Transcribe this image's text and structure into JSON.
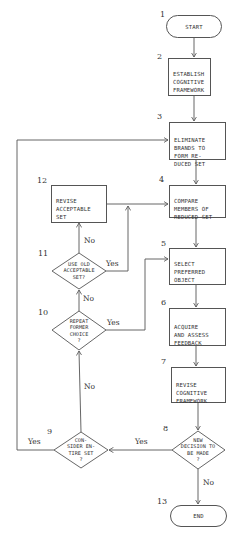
{
  "diagram": {
    "type": "flowchart",
    "nodes": [
      {
        "id": "1",
        "shape": "terminator",
        "number": "1",
        "text": "START"
      },
      {
        "id": "2",
        "shape": "process",
        "number": "2",
        "text": "ESTABLISH\nCOGNITIVE\nFRAMEWORK"
      },
      {
        "id": "3",
        "shape": "process",
        "number": "3",
        "text": "ELIMINATE\nBRANDS TO\nFORM RE-\nDUCED SET"
      },
      {
        "id": "4",
        "shape": "process",
        "number": "4",
        "text": "COMPARE\nMEMBERS OF\nREDUCED SET"
      },
      {
        "id": "5",
        "shape": "process",
        "number": "5",
        "text": "SELECT\nPREFERRED\nOBJECT"
      },
      {
        "id": "6",
        "shape": "process",
        "number": "6",
        "text": "ACQUIRE\nAND ASSESS\nFEEDBACK"
      },
      {
        "id": "7",
        "shape": "process",
        "number": "7",
        "text": "REVISE\nCOGNITIVE\nFRAMEWORK"
      },
      {
        "id": "8",
        "shape": "decision",
        "number": "8",
        "text": "NEW\nDECISION TO\nBE MADE\n?"
      },
      {
        "id": "9",
        "shape": "decision",
        "number": "9",
        "text": "CON-\nSIDER EN-\nTIRE SET\n?"
      },
      {
        "id": "10",
        "shape": "decision",
        "number": "10",
        "text": "REPEAT\nFORMER\nCHOICE\n?"
      },
      {
        "id": "11",
        "shape": "decision",
        "number": "11",
        "text": "USE OLD\nACCEPTABLE\nSET?"
      },
      {
        "id": "12",
        "shape": "process",
        "number": "12",
        "text": "REVISE\nACCEPTABLE\nSET"
      },
      {
        "id": "13",
        "shape": "terminator",
        "number": "13",
        "text": "END"
      }
    ],
    "edges": [
      {
        "from": "1",
        "to": "2",
        "label": ""
      },
      {
        "from": "2",
        "to": "3",
        "label": ""
      },
      {
        "from": "3",
        "to": "4",
        "label": ""
      },
      {
        "from": "4",
        "to": "5",
        "label": ""
      },
      {
        "from": "5",
        "to": "6",
        "label": ""
      },
      {
        "from": "6",
        "to": "7",
        "label": ""
      },
      {
        "from": "7",
        "to": "8",
        "label": ""
      },
      {
        "from": "8",
        "to": "9",
        "label": "Yes"
      },
      {
        "from": "8",
        "to": "13",
        "label": "No"
      },
      {
        "from": "9",
        "to": "3",
        "label": "Yes"
      },
      {
        "from": "9",
        "to": "10",
        "label": "No"
      },
      {
        "from": "10",
        "to": "5",
        "label": "Yes"
      },
      {
        "from": "10",
        "to": "11",
        "label": "No"
      },
      {
        "from": "11",
        "to": "4",
        "label": "Yes"
      },
      {
        "from": "11",
        "to": "12",
        "label": "No"
      },
      {
        "from": "12",
        "to": "4",
        "label": ""
      }
    ],
    "edge_labels": {
      "e8_9": "Yes",
      "e8_13": "No",
      "e9_3": "Yes",
      "e9_10": "No",
      "e10_5": "Yes",
      "e10_11": "No",
      "e11_4": "Yes",
      "e11_12": "No"
    },
    "colors": {
      "line": "#555555",
      "text": "#333333",
      "background": "#ffffff"
    }
  }
}
